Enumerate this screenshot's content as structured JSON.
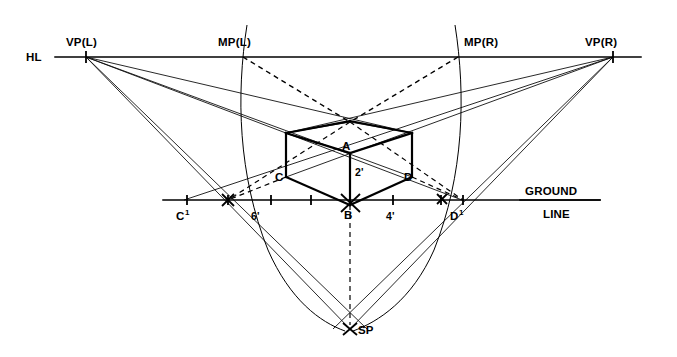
{
  "diagram": {
    "type": "technical-perspective-drawing",
    "background_color": "#ffffff",
    "line_color": "#000000",
    "labels": {
      "hl": "HL",
      "vp_left": "VP(L)",
      "vp_right": "VP(R)",
      "mp_left": "MP(L)",
      "mp_right": "MP(R)",
      "ground_line_1": "GROUND",
      "ground_line_2": "LINE",
      "sp": "SP",
      "point_a": "A",
      "point_b": "B",
      "point_c": "C",
      "point_d": "D",
      "point_c1": "C",
      "point_c1_sup": "1",
      "point_d1": "D",
      "point_d1_sup": "1",
      "height_2ft": "2'",
      "depth_6ft": "6'",
      "width_4ft": "4'"
    },
    "points": {
      "vp_left": {
        "x": 86,
        "y": 57
      },
      "vp_right": {
        "x": 613,
        "y": 57
      },
      "mp_left": {
        "x": 243,
        "y": 57
      },
      "mp_right": {
        "x": 458,
        "y": 57
      },
      "sp": {
        "x": 350,
        "y": 329
      },
      "a": {
        "x": 350,
        "y": 153
      },
      "b": {
        "x": 350,
        "y": 205
      },
      "c": {
        "x": 286,
        "y": 177
      },
      "d": {
        "x": 412,
        "y": 177
      },
      "rear_top": {
        "x": 350,
        "y": 122
      },
      "c1": {
        "x": 184,
        "y": 200
      },
      "d1": {
        "x": 462,
        "y": 200
      }
    },
    "axes": {
      "horizon_line_y": 57,
      "horizon_line_x1": 55,
      "horizon_line_x2": 641,
      "ground_line_y": 200,
      "ground_line_x1": 163,
      "ground_line_x2": 600
    },
    "ground_ticks": [
      {
        "x": 187,
        "label": ""
      },
      {
        "x": 228,
        "label": ""
      },
      {
        "x": 271,
        "label": ""
      },
      {
        "x": 311,
        "label": ""
      },
      {
        "x": 350,
        "label": ""
      },
      {
        "x": 393,
        "label": ""
      },
      {
        "x": 441,
        "label": ""
      },
      {
        "x": 463,
        "label": ""
      }
    ],
    "measurements": {
      "box_height": "2'",
      "box_depth": "6'",
      "box_width": "4'"
    },
    "notes": {
      "dashed_elements": "measuring lines from MP(L) and MP(R), vertical drop from B to SP, ground measuring lines",
      "arcs": "two swing arcs through MP(L) and MP(R) descending toward SP"
    }
  }
}
